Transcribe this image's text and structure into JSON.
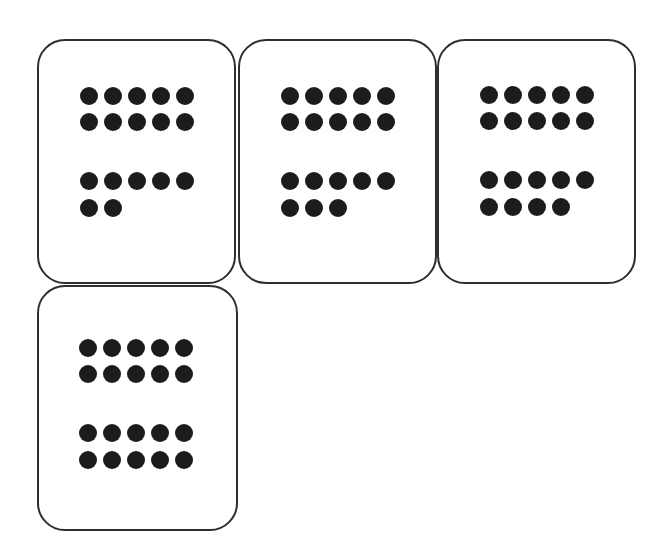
{
  "diagram": {
    "type": "ten-frame dot cards",
    "dot_color": "#1c1c1c",
    "border_color": "#2e2e2e",
    "cards": [
      {
        "label": "17",
        "total": 17,
        "top_group": 10,
        "bottom_group": 7,
        "rows": [
          5,
          5,
          5,
          2
        ],
        "box": [
          37,
          39,
          199,
          245
        ],
        "first_dot": [
          80,
          87
        ]
      },
      {
        "label": "18",
        "total": 18,
        "top_group": 10,
        "bottom_group": 8,
        "rows": [
          5,
          5,
          5,
          3
        ],
        "box": [
          238,
          39,
          199,
          245
        ],
        "first_dot": [
          281,
          87
        ]
      },
      {
        "label": "19",
        "total": 19,
        "top_group": 10,
        "bottom_group": 9,
        "rows": [
          5,
          5,
          5,
          4
        ],
        "box": [
          437,
          39,
          199,
          245
        ],
        "first_dot": [
          480,
          86
        ]
      },
      {
        "label": "20",
        "total": 20,
        "top_group": 10,
        "bottom_group": 10,
        "rows": [
          5,
          5,
          5,
          5
        ],
        "box": [
          37,
          285,
          201,
          246
        ],
        "first_dot": [
          79,
          339
        ]
      }
    ]
  }
}
